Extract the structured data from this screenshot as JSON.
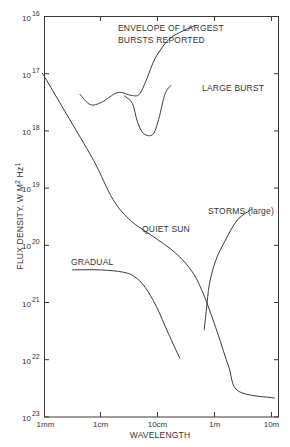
{
  "chart_data": {
    "type": "line",
    "title": "",
    "xlabel": "WAVELENGTH",
    "ylabel": "FLUX DENSITY, W M-2 Hz-1",
    "x_scale": "log",
    "y_scale": "log",
    "x_ticks": [
      {
        "label": "1mm",
        "log10_m": -3
      },
      {
        "label": "1cm",
        "log10_m": -2
      },
      {
        "label": "10cm",
        "log10_m": -1
      },
      {
        "label": "1m",
        "log10_m": 0
      },
      {
        "label": "10m",
        "log10_m": 1
      }
    ],
    "y_ticks": [
      {
        "base": "10",
        "exp": "16",
        "log10": -16
      },
      {
        "base": "10",
        "exp": "17",
        "log10": -17
      },
      {
        "base": "10",
        "exp": "18",
        "log10": -18
      },
      {
        "base": "10",
        "exp": "19",
        "log10": -19
      },
      {
        "base": "10",
        "exp": "20",
        "log10": -20
      },
      {
        "base": "10",
        "exp": "21",
        "log10": -21
      },
      {
        "base": "10",
        "exp": "22",
        "log10": -22
      },
      {
        "base": "10",
        "exp": "23",
        "log10": -23
      }
    ],
    "xlim_log10": [
      -3,
      1.12
    ],
    "ylim_log10": [
      -23,
      -16
    ],
    "grid": false,
    "series": [
      {
        "name": "ENVELOPE OF LARGEST BURSTS REPORTED",
        "points_log10": [
          [
            -2.36,
            -17.36
          ],
          [
            -2.18,
            -17.54
          ],
          [
            -1.98,
            -17.5
          ],
          [
            -1.7,
            -17.33
          ],
          [
            -1.46,
            -17.38
          ],
          [
            -1.32,
            -17.36
          ],
          [
            -1.2,
            -17.12
          ],
          [
            -1.04,
            -16.73
          ],
          [
            -0.8,
            -16.4
          ],
          [
            -0.55,
            -16.25
          ],
          [
            -0.35,
            -16.16
          ]
        ],
        "label": {
          "lines": [
            "ENVELOPE OF LARGEST",
            "BURSTS REPORTED"
          ],
          "x": 118,
          "y": [
            31,
            43
          ]
        }
      },
      {
        "name": "LARGE BURST",
        "points_log10": [
          [
            -1.58,
            -17.39
          ],
          [
            -1.44,
            -17.52
          ],
          [
            -1.35,
            -17.85
          ],
          [
            -1.24,
            -18.05
          ],
          [
            -1.08,
            -18.06
          ],
          [
            -0.98,
            -17.8
          ],
          [
            -0.87,
            -17.36
          ],
          [
            -0.77,
            -17.21
          ]
        ],
        "label": {
          "lines": [
            "LARGE BURST"
          ],
          "x": 202,
          "y": [
            91
          ]
        }
      },
      {
        "name": "QUIET SUN",
        "points_log10": [
          [
            -3.02,
            -16.99
          ],
          [
            -2.6,
            -17.7
          ],
          [
            -2.12,
            -18.52
          ],
          [
            -1.78,
            -19.2
          ],
          [
            -1.47,
            -19.57
          ],
          [
            -1.1,
            -19.83
          ],
          [
            -0.7,
            -20.12
          ],
          [
            -0.4,
            -20.45
          ],
          [
            -0.2,
            -20.84
          ],
          [
            0.05,
            -21.52
          ],
          [
            0.25,
            -22.13
          ],
          [
            0.42,
            -22.55
          ],
          [
            1.05,
            -22.67
          ]
        ],
        "label": {
          "lines": [
            "QUIET SUN"
          ],
          "x": 142,
          "y": [
            232
          ]
        }
      },
      {
        "name": "GRADUAL",
        "points_log10": [
          [
            -2.49,
            -20.43
          ],
          [
            -2.0,
            -20.43
          ],
          [
            -1.6,
            -20.47
          ],
          [
            -1.4,
            -20.55
          ],
          [
            -1.22,
            -20.73
          ],
          [
            -1.02,
            -21.07
          ],
          [
            -0.81,
            -21.54
          ],
          [
            -0.61,
            -21.97
          ]
        ],
        "label": {
          "lines": [
            "GRADUAL"
          ],
          "x": 71,
          "y": [
            265
          ]
        }
      },
      {
        "name": "STORMS (large)",
        "points_log10": [
          [
            -0.18,
            -21.47
          ],
          [
            -0.14,
            -21.11
          ],
          [
            -0.09,
            -20.68
          ],
          [
            0.02,
            -20.27
          ],
          [
            0.18,
            -19.93
          ],
          [
            0.4,
            -19.56
          ],
          [
            0.65,
            -19.37
          ]
        ],
        "label": {
          "lines": [
            "STORMS (large)"
          ],
          "x": 208,
          "y": [
            214
          ]
        }
      }
    ]
  },
  "axes": {
    "x_label": "WAVELENGTH",
    "y_label_main": "FLUX DENSITY, W M",
    "y_label_exp1": "2",
    "y_label_mid": " Hz",
    "y_label_exp2": "1"
  },
  "colors": {
    "ink": "#3a3a3a",
    "background": "#ffffff"
  }
}
